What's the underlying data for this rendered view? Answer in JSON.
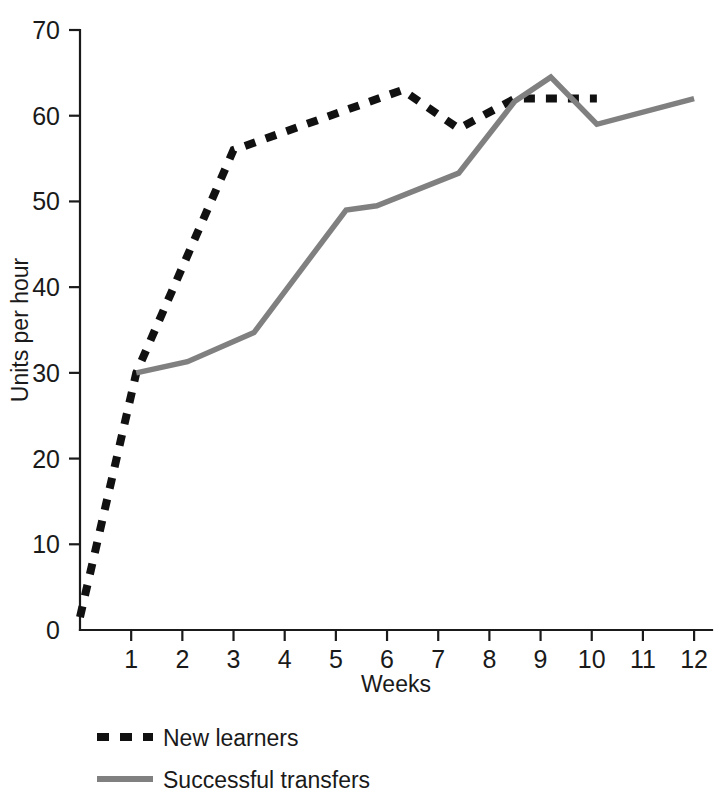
{
  "chart_data": {
    "type": "line",
    "title": "",
    "xlabel": "Weeks",
    "ylabel": "Units per hour",
    "xlim": [
      0,
      12.35
    ],
    "ylim": [
      0,
      70
    ],
    "grid": false,
    "legend_position": "bottom-left",
    "x_ticks": [
      1,
      2,
      3,
      4,
      5,
      6,
      7,
      8,
      9,
      10,
      11,
      12
    ],
    "x_tick_labels": [
      "1",
      "2",
      "3",
      "4",
      "5",
      "6",
      "7",
      "8",
      "9",
      "10",
      "11",
      "12"
    ],
    "y_ticks": [
      0,
      10,
      20,
      30,
      40,
      50,
      60,
      70
    ],
    "y_tick_labels": [
      "0",
      "10",
      "20",
      "30",
      "40",
      "50",
      "60",
      "70"
    ],
    "series": [
      {
        "name": "New learners",
        "style": "dashed",
        "color": "#111111",
        "points": [
          {
            "x": 0.0,
            "y": 1.5
          },
          {
            "x": 1.1,
            "y": 30.0
          },
          {
            "x": 3.0,
            "y": 56.0
          },
          {
            "x": 6.3,
            "y": 63.0
          },
          {
            "x": 7.4,
            "y": 58.5
          },
          {
            "x": 8.5,
            "y": 62.0
          },
          {
            "x": 10.1,
            "y": 62.0
          }
        ]
      },
      {
        "name": "Successful transfers",
        "style": "solid",
        "color": "#808080",
        "points": [
          {
            "x": 1.1,
            "y": 30.0
          },
          {
            "x": 2.1,
            "y": 31.3
          },
          {
            "x": 3.4,
            "y": 34.7
          },
          {
            "x": 5.2,
            "y": 49.0
          },
          {
            "x": 5.8,
            "y": 49.5
          },
          {
            "x": 7.4,
            "y": 53.3
          },
          {
            "x": 8.5,
            "y": 61.7
          },
          {
            "x": 9.2,
            "y": 64.5
          },
          {
            "x": 10.1,
            "y": 59.0
          },
          {
            "x": 12.0,
            "y": 62.0
          }
        ]
      }
    ]
  },
  "legend": {
    "items": [
      {
        "label": "New learners",
        "style": "dashed",
        "color": "#111111"
      },
      {
        "label": "Successful transfers",
        "style": "solid",
        "color": "#808080"
      }
    ]
  },
  "colors": {
    "new_learners": "#111111",
    "successful_transfers": "#808080",
    "axis": "#1a1a1a",
    "background": "#ffffff"
  }
}
